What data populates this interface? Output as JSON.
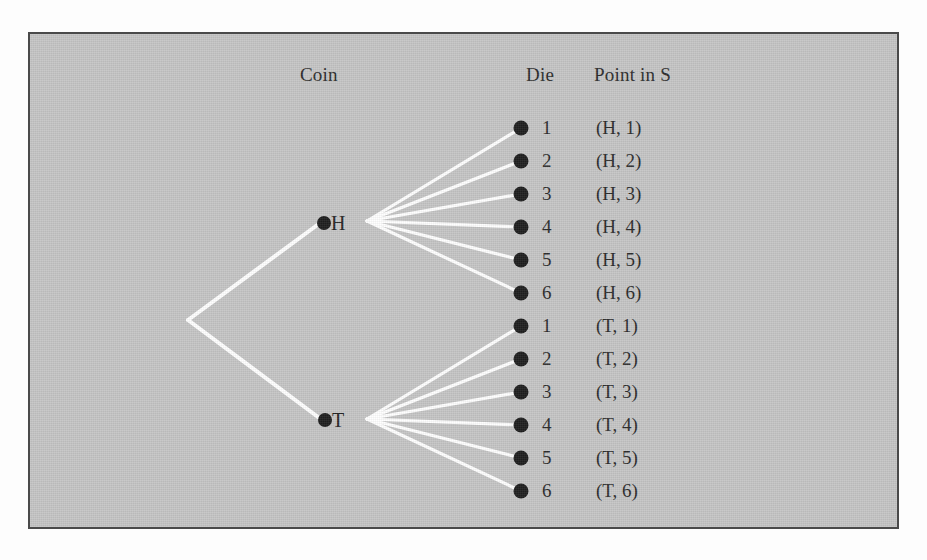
{
  "figure": {
    "type": "probability-tree-diagram",
    "background_color": "#c5c5c5",
    "border_color": "#4a4a4a",
    "branch_color": "#ffffff",
    "node_color": "#1e1e1e",
    "text_color": "#2b2b2b"
  },
  "headers": {
    "coin": "Coin",
    "die": "Die",
    "point": "Point in S"
  },
  "coin_nodes": [
    {
      "label": "H",
      "name": "heads"
    },
    {
      "label": "T",
      "name": "tails"
    }
  ],
  "die_faces": [
    "1",
    "2",
    "3",
    "4",
    "5",
    "6"
  ],
  "outcomes": [
    {
      "die": "1",
      "point": "(H, 1)",
      "coin": "H"
    },
    {
      "die": "2",
      "point": "(H, 2)",
      "coin": "H"
    },
    {
      "die": "3",
      "point": "(H, 3)",
      "coin": "H"
    },
    {
      "die": "4",
      "point": "(H, 4)",
      "coin": "H"
    },
    {
      "die": "5",
      "point": "(H, 5)",
      "coin": "H"
    },
    {
      "die": "6",
      "point": "(H, 6)",
      "coin": "H"
    },
    {
      "die": "1",
      "point": "(T, 1)",
      "coin": "T"
    },
    {
      "die": "2",
      "point": "(T, 2)",
      "coin": "T"
    },
    {
      "die": "3",
      "point": "(T, 3)",
      "coin": "T"
    },
    {
      "die": "4",
      "point": "(T, 4)",
      "coin": "T"
    },
    {
      "die": "5",
      "point": "(T, 5)",
      "coin": "T"
    },
    {
      "die": "6",
      "point": "(T, 6)",
      "coin": "T"
    }
  ]
}
